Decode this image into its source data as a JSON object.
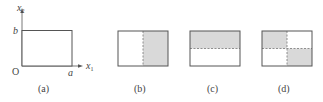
{
  "colors": {
    "line": "#555555",
    "shade": "#d9d9d9",
    "dash": "#777777",
    "text": "#444444"
  },
  "panel_a": {
    "caption": "(a)",
    "origin_label": "O",
    "x_axis_label": "x",
    "x_axis_subscript": "1",
    "y_axis_label": "x",
    "y_axis_subscript": "2",
    "width_label": "a",
    "height_label": "b"
  },
  "panel_b": {
    "caption": "(b)",
    "split": "vertical",
    "shaded_region": "right half"
  },
  "panel_c": {
    "caption": "(c)",
    "split": "horizontal",
    "shaded_region": "top half"
  },
  "panel_d": {
    "caption": "(d)",
    "split": "quadrants",
    "shaded_region": "top-left and bottom-right quadrants"
  }
}
